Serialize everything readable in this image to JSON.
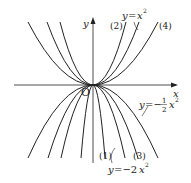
{
  "diagram": {
    "axes": {
      "x_label": "x",
      "y_label": "y",
      "origin_label": "O"
    },
    "labels": {
      "upper_curve_2": "(2)",
      "upper_curve_4": "(4)",
      "lower_curve_1": "(1)",
      "lower_curve_3": "(3)",
      "eq_x2_y": "y",
      "eq_x2_eq": "=",
      "eq_x2_x": "x",
      "eq_x2_exp": "2",
      "eq_half_y": "y",
      "eq_half_eq": "=−",
      "eq_half_num": "1",
      "eq_half_den": "2",
      "eq_half_x": "x",
      "eq_half_exp": "2",
      "eq_2x2_y": "y",
      "eq_2x2_eq": "=−2",
      "eq_2x2_x": "x",
      "eq_2x2_exp": "2"
    },
    "curves": {
      "upward": [
        "(2)",
        "y=x²",
        "(4)"
      ],
      "downward": [
        "(1)",
        "y=−2x²",
        "(3)",
        "y=−½x²"
      ]
    },
    "colors": {
      "line": "#222222",
      "background": "#ffffff"
    }
  }
}
